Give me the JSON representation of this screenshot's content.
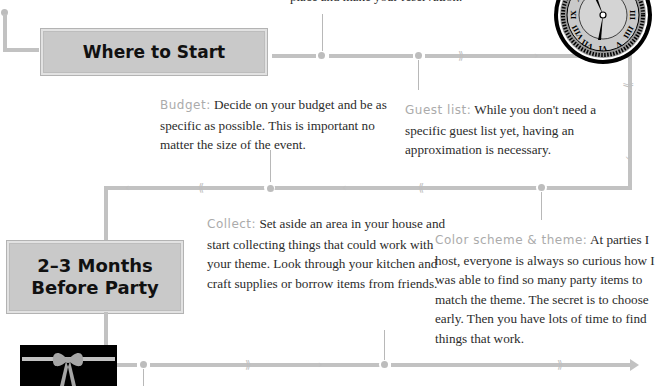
{
  "top_snippet": "place and make your reservation.",
  "stages": [
    {
      "title": "Where to Start"
    },
    {
      "title_line1": "2–3 Months",
      "title_line2": "Before Party"
    }
  ],
  "notes": {
    "budget": {
      "label": "Budget:",
      "text": " Decide on your budget and be as specific as possible. This is important no matter the size of the event."
    },
    "guest_list": {
      "label": "Guest list:",
      "text": " While you don't need a specific guest list yet, having an approximation is necessary."
    },
    "collect": {
      "label": "Collect:",
      "text": " Set aside an area in your house and start collecting things that could work with your theme. Look through your kitchen and craft supplies or borrow items from friends."
    },
    "color_scheme": {
      "label": "Color scheme & theme:",
      "text": " At parties I host, everyone is always so curious how I was able to find so many party items to match the theme. The secret is to choose early. Then you have lots of time to find things that work."
    }
  },
  "icons": {
    "clock": "clock-icon",
    "gift": "gift-box-icon"
  },
  "colors": {
    "line": "#c2c2c2",
    "banner": "#c9c9c9",
    "label": "#ababab",
    "text": "#2b2b2b"
  }
}
